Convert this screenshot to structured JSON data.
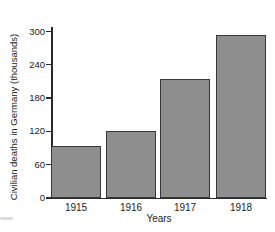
{
  "chart_data": {
    "type": "bar",
    "categories": [
      "1915",
      "1916",
      "1917",
      "1918"
    ],
    "values": [
      93,
      121,
      215,
      294
    ],
    "title": "",
    "xlabel": "Years",
    "ylabel": "Civilian deaths in Germany (thousands)",
    "ylim": [
      0,
      300
    ],
    "yticks": [
      0,
      60,
      120,
      180,
      240,
      300
    ],
    "grid": false,
    "legend": false,
    "colors": {
      "bar_fill": "#8e8e8e",
      "bar_border": "#383838",
      "axis": "#2a2a2a",
      "text": "#1b1b1b",
      "background": "#ffffff"
    }
  }
}
